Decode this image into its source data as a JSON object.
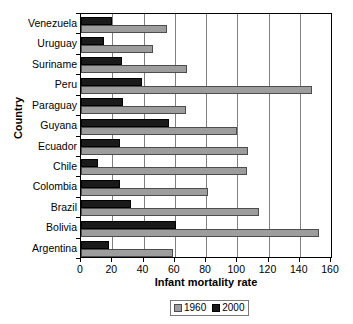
{
  "chart_data": {
    "type": "bar",
    "title": "",
    "xlabel": "Infant mortality rate",
    "ylabel": "Country",
    "orientation": "horizontal",
    "xlim": [
      0,
      160
    ],
    "xticks": [
      0,
      20,
      40,
      60,
      80,
      100,
      120,
      140,
      160
    ],
    "grid": "vertical",
    "legend_position": "bottom",
    "categories": [
      "Venezuela",
      "Uruguay",
      "Suriname",
      "Peru",
      "Paraguay",
      "Guyana",
      "Ecuador",
      "Chile",
      "Colombia",
      "Brazil",
      "Bolivia",
      "Argentina"
    ],
    "series": [
      {
        "name": "1960",
        "color": "#9d9d9d",
        "values": [
          55,
          46,
          68,
          148,
          67,
          100,
          107,
          106,
          81,
          114,
          152,
          59
        ]
      },
      {
        "name": "2000",
        "color": "#1a1a1a",
        "values": [
          20,
          15,
          26,
          39,
          27,
          56,
          25,
          11,
          25,
          32,
          61,
          18
        ]
      }
    ]
  },
  "legend": {
    "items": [
      {
        "label": "1960"
      },
      {
        "label": "2000"
      }
    ]
  }
}
